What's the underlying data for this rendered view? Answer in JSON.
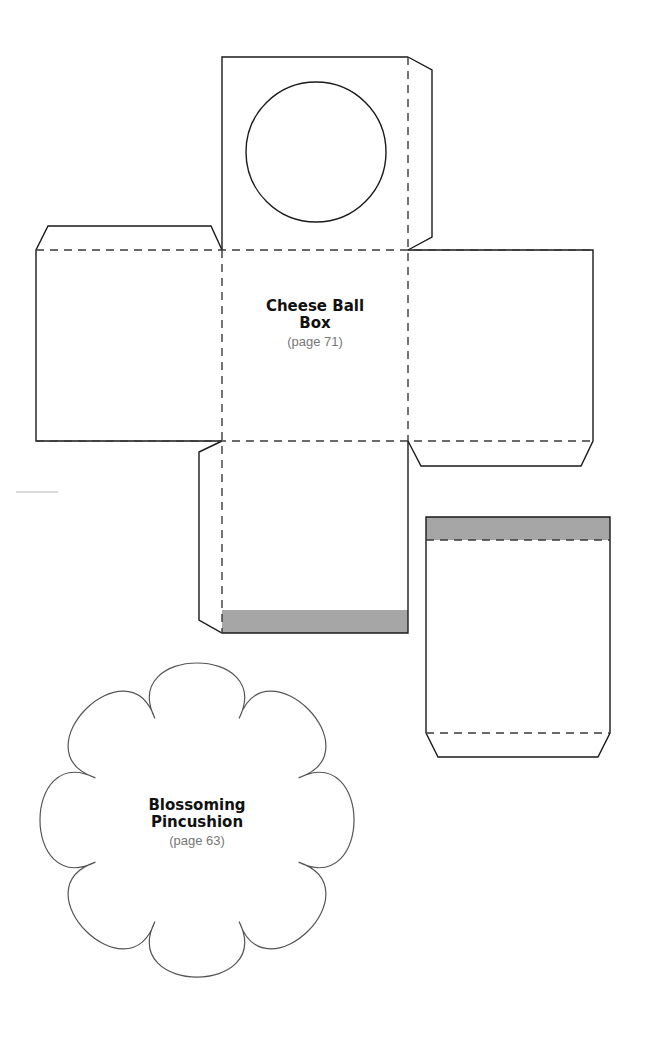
{
  "templates": {
    "cheese_ball_box": {
      "title_line1": "Cheese Ball",
      "title_line2": "Box",
      "page_ref": "(page 71)"
    },
    "blossoming_pincushion": {
      "title_line1": "Blossoming",
      "title_line2": "Pincushion",
      "page_ref": "(page 63)"
    }
  },
  "legend": {
    "solid_line": "cut-line",
    "dashed_line": "fold-line",
    "gray_band": "glue-area"
  },
  "colors": {
    "line": "#1a1a1a",
    "glue_shade": "#a6a6a6",
    "page_ref_text": "#777777"
  }
}
